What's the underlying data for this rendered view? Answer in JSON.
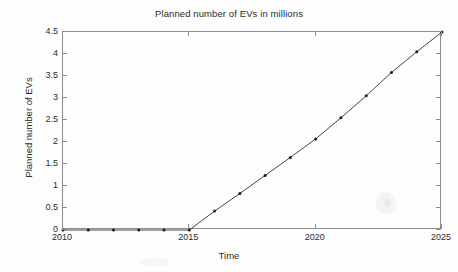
{
  "chart_data": {
    "type": "line",
    "title": "Planned number of EVs in millions",
    "xlabel": "Time",
    "ylabel": "Planned number of EVs",
    "x": [
      2010,
      2011,
      2012,
      2013,
      2014,
      2015,
      2016,
      2017,
      2018,
      2019,
      2020,
      2021,
      2022,
      2023,
      2024,
      2025
    ],
    "values": [
      0,
      0,
      0,
      0,
      0,
      0,
      0.43,
      0.83,
      1.24,
      1.65,
      2.07,
      2.55,
      3.05,
      3.58,
      4.05,
      4.5
    ],
    "series": [
      {
        "name": "Planned number of EVs",
        "values": [
          0,
          0,
          0,
          0,
          0,
          0,
          0.43,
          0.83,
          1.24,
          1.65,
          2.07,
          2.55,
          3.05,
          3.58,
          4.05,
          4.5
        ]
      }
    ],
    "xlim": [
      2010,
      2025
    ],
    "ylim": [
      0,
      4.5
    ],
    "xticks": [
      2010,
      2015,
      2020,
      2025
    ],
    "xtick_labels": [
      "2010",
      "2015",
      "2020",
      "2025"
    ],
    "yticks": [
      0,
      0.5,
      1,
      1.5,
      2,
      2.5,
      3,
      3.5,
      4,
      4.5
    ],
    "ytick_labels": [
      "0",
      "0.5",
      "1",
      "1.5",
      "2",
      "2.5",
      "3",
      "3.5",
      "4",
      "4.5"
    ],
    "grid": false,
    "legend": null,
    "legend_position": "none",
    "marker": "point",
    "line_color": "#303030",
    "marker_color": "#1a1a1a",
    "axis_color": "#8c8c8c",
    "background_color": "#fdfdfd"
  }
}
